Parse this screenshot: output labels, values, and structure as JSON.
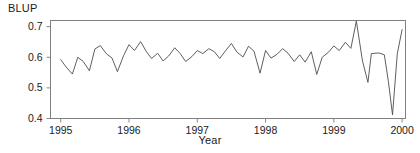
{
  "chart_data": {
    "type": "line",
    "title": "",
    "xlabel": "Year",
    "ylabel": "BLUP",
    "xlim": [
      1994.85,
      2000.05
    ],
    "ylim": [
      0.4,
      0.72
    ],
    "grid": false,
    "legend": null,
    "xticks": [
      1995,
      1996,
      1997,
      1998,
      1999,
      2000
    ],
    "xtick_labels": [
      "1995",
      "1996",
      "1997",
      "1998",
      "1999",
      "2000"
    ],
    "yticks": [
      0.4,
      0.5,
      0.6,
      0.7
    ],
    "ytick_labels": [
      "0.4",
      "0.5",
      "0.6",
      "0.7"
    ],
    "line_color": "#4d4d4d",
    "frame_color": "#808080",
    "series": [
      {
        "name": "BLUP",
        "x": [
          1995.0,
          1995.08,
          1995.17,
          1995.25,
          1995.33,
          1995.42,
          1995.5,
          1995.58,
          1995.67,
          1995.75,
          1995.83,
          1995.92,
          1996.0,
          1996.08,
          1996.17,
          1996.25,
          1996.33,
          1996.42,
          1996.5,
          1996.58,
          1996.67,
          1996.75,
          1996.83,
          1996.92,
          1997.0,
          1997.08,
          1997.17,
          1997.25,
          1997.33,
          1997.42,
          1997.5,
          1997.58,
          1997.67,
          1997.75,
          1997.83,
          1997.92,
          1998.0,
          1998.08,
          1998.17,
          1998.25,
          1998.33,
          1998.42,
          1998.5,
          1998.58,
          1998.67,
          1998.75,
          1998.83,
          1998.92,
          1999.0,
          1999.08,
          1999.17,
          1999.25,
          1999.33,
          1999.42,
          1999.5,
          1999.58,
          1999.67,
          1999.75,
          1999.83,
          1999.92,
          2000.0
        ],
        "values": [
          0.592,
          0.568,
          0.545,
          0.6,
          0.586,
          0.556,
          0.627,
          0.638,
          0.611,
          0.598,
          0.553,
          0.605,
          0.641,
          0.622,
          0.651,
          0.62,
          0.596,
          0.613,
          0.588,
          0.604,
          0.631,
          0.612,
          0.586,
          0.602,
          0.622,
          0.612,
          0.628,
          0.618,
          0.596,
          0.623,
          0.645,
          0.617,
          0.601,
          0.636,
          0.62,
          0.548,
          0.622,
          0.597,
          0.61,
          0.628,
          0.613,
          0.586,
          0.608,
          0.584,
          0.618,
          0.544,
          0.6,
          0.616,
          0.637,
          0.622,
          0.649,
          0.629,
          0.718,
          0.588,
          0.518,
          0.66,
          0.596,
          0.709,
          0.56,
          0.648,
          0.62
        ]
      }
    ],
    "tail_segment": {
      "note": "final descent and rebound",
      "x": [
        1999.55,
        1999.66,
        1999.74,
        1999.8,
        1999.86,
        1999.93,
        2000.0
      ],
      "values": [
        0.612,
        0.614,
        0.608,
        0.52,
        0.412,
        0.612,
        0.69
      ]
    }
  }
}
